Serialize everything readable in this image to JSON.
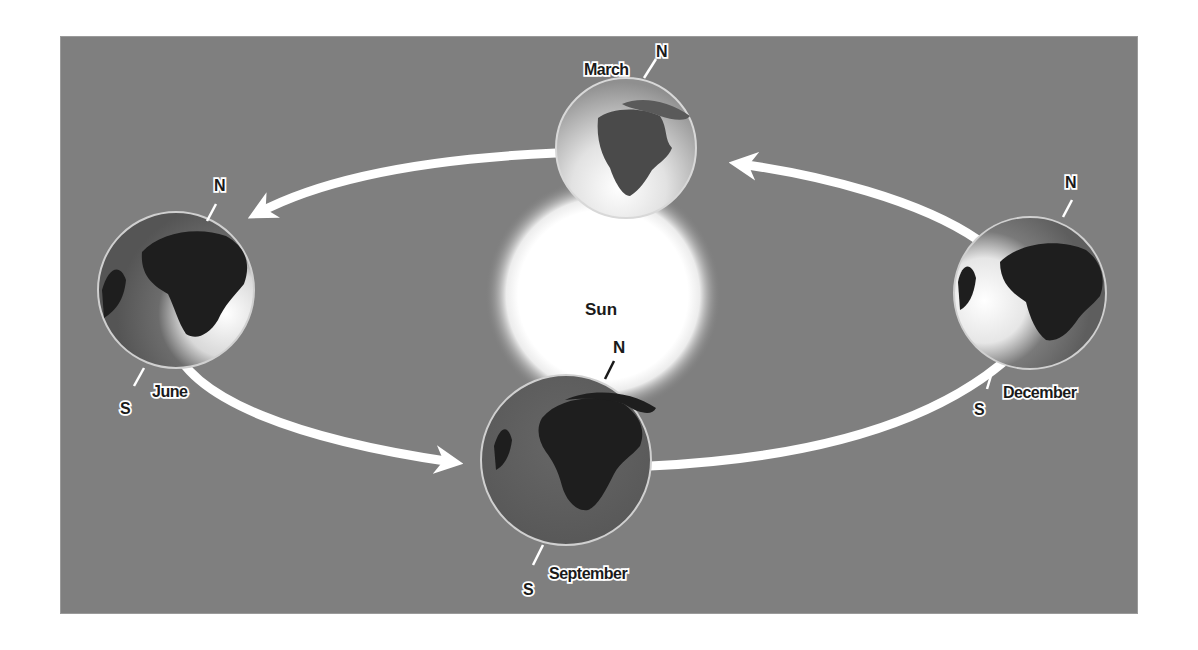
{
  "diagram": {
    "type": "earth-orbit-seasons",
    "background_color": "#7f7f7f",
    "sun": {
      "label": "Sun"
    },
    "globes": [
      {
        "id": "march",
        "label": "March",
        "north": "N",
        "south": ""
      },
      {
        "id": "june",
        "label": "June",
        "north": "N",
        "south": "S"
      },
      {
        "id": "september",
        "label": "September",
        "north": "N",
        "south": "S"
      },
      {
        "id": "december",
        "label": "December",
        "north": "N",
        "south": "S"
      }
    ],
    "arrows": [
      {
        "from": "march",
        "to": "june"
      },
      {
        "from": "june",
        "to": "september"
      },
      {
        "from": "september",
        "to": "december"
      },
      {
        "from": "december",
        "to": "march"
      }
    ]
  }
}
